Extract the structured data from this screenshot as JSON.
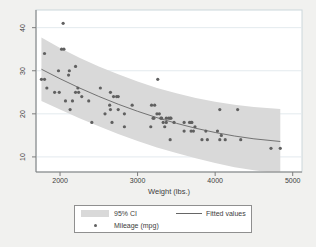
{
  "colors": {
    "background": "#f1f1ef",
    "plot_background": "#ffffff",
    "plot_border": "#ccd7db",
    "axis": "#7d7d7d",
    "grid": "#e3eaee",
    "band": "#d9d9d9",
    "fit_line": "#666666",
    "dot": "#606060",
    "text": "#3d3d3d"
  },
  "chart_data": {
    "type": "scatter",
    "title": "",
    "xlabel": "Weight (lbs.)",
    "ylabel": "",
    "xlim": [
      1690,
      5120
    ],
    "ylim": [
      6.5,
      44.1
    ],
    "x_ticks": [
      2000,
      3000,
      4000,
      5000
    ],
    "y_ticks": [
      10,
      20,
      30,
      40
    ],
    "grid": "horizontal",
    "legend": {
      "position": "bottom-center",
      "items": [
        {
          "label": "95% CI",
          "marker": "area"
        },
        {
          "label": "Fitted values",
          "marker": "line"
        },
        {
          "label": "Mileage (mpg)",
          "marker": "dot"
        }
      ]
    },
    "series": [
      {
        "name": "95% CI",
        "type": "area",
        "x": [
          1760,
          2000,
          2250,
          2500,
          2750,
          3000,
          3250,
          3500,
          3750,
          4000,
          4250,
          4500,
          4840
        ],
        "lo": [
          23.0,
          21.0,
          19.0,
          17.1,
          15.3,
          13.7,
          12.2,
          10.9,
          9.7,
          8.6,
          7.6,
          6.9,
          6.1
        ],
        "hi": [
          37.7,
          35.3,
          33.0,
          31.0,
          29.2,
          27.5,
          26.0,
          24.8,
          23.7,
          22.8,
          22.1,
          21.6,
          21.1
        ]
      },
      {
        "name": "Fitted values",
        "type": "line",
        "x": [
          1760,
          2000,
          2250,
          2500,
          2750,
          3000,
          3250,
          3500,
          3750,
          4000,
          4250,
          4500,
          4840
        ],
        "y": [
          30.35,
          28.15,
          26.01,
          24.04,
          22.23,
          20.59,
          19.11,
          17.8,
          16.65,
          15.67,
          14.85,
          14.2,
          13.58
        ]
      },
      {
        "name": "Mileage (mpg)",
        "type": "scatter",
        "points": [
          [
            2930,
            22
          ],
          [
            3350,
            17
          ],
          [
            2640,
            22
          ],
          [
            3250,
            20
          ],
          [
            4080,
            15
          ],
          [
            3670,
            18
          ],
          [
            2230,
            26
          ],
          [
            3280,
            20
          ],
          [
            3880,
            16
          ],
          [
            3400,
            19
          ],
          [
            4330,
            14
          ],
          [
            3900,
            14
          ],
          [
            4290,
            21
          ],
          [
            2110,
            29
          ],
          [
            3690,
            16
          ],
          [
            3180,
            22
          ],
          [
            3220,
            22
          ],
          [
            2750,
            24
          ],
          [
            3430,
            19
          ],
          [
            2120,
            30
          ],
          [
            3600,
            18
          ],
          [
            3600,
            16
          ],
          [
            3740,
            17
          ],
          [
            1800,
            28
          ],
          [
            2650,
            21
          ],
          [
            4840,
            12
          ],
          [
            4720,
            12
          ],
          [
            3830,
            14
          ],
          [
            2580,
            20
          ],
          [
            4060,
            14
          ],
          [
            3720,
            16
          ],
          [
            3370,
            18
          ],
          [
            4130,
            14
          ],
          [
            2830,
            20
          ],
          [
            4060,
            21
          ],
          [
            3310,
            19
          ],
          [
            3300,
            19
          ],
          [
            3690,
            18
          ],
          [
            3370,
            19
          ],
          [
            2730,
            24
          ],
          [
            4030,
            16
          ],
          [
            3260,
            28
          ],
          [
            1800,
            34
          ],
          [
            2200,
            25
          ],
          [
            2520,
            26
          ],
          [
            3330,
            18
          ],
          [
            3700,
            18
          ],
          [
            3470,
            18
          ],
          [
            3210,
            19
          ],
          [
            3200,
            19
          ],
          [
            3420,
            19
          ],
          [
            2690,
            24
          ],
          [
            2830,
            17
          ],
          [
            2070,
            23
          ],
          [
            2650,
            25
          ],
          [
            2370,
            23
          ],
          [
            2020,
            35
          ],
          [
            2280,
            24
          ],
          [
            2750,
            21
          ],
          [
            2130,
            21
          ],
          [
            2240,
            25
          ],
          [
            1760,
            28
          ],
          [
            1980,
            30
          ],
          [
            3420,
            14
          ],
          [
            1830,
            26
          ],
          [
            2050,
            35
          ],
          [
            2410,
            18
          ],
          [
            2200,
            31
          ],
          [
            2670,
            18
          ],
          [
            2160,
            23
          ],
          [
            2040,
            41
          ],
          [
            1930,
            25
          ],
          [
            1990,
            25
          ],
          [
            3170,
            17
          ]
        ]
      }
    ]
  }
}
